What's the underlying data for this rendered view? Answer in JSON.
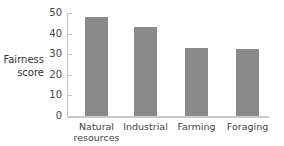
{
  "chart_data": {
    "type": "bar",
    "title": "",
    "xlabel": "",
    "ylabel": "Fairness score",
    "ylabel_lines": [
      "Fairness",
      "score"
    ],
    "ylim": [
      0,
      50
    ],
    "yticks": [
      "0",
      "10",
      "20",
      "30",
      "40",
      "50"
    ],
    "categories": [
      "Natural resources",
      "Industrial",
      "Farming",
      "Foraging"
    ],
    "category_lines": [
      [
        "Natural",
        "resources"
      ],
      [
        "Industrial"
      ],
      [
        "Farming"
      ],
      [
        "Foraging"
      ]
    ],
    "values": [
      48,
      43,
      33,
      32.5
    ],
    "bar_color": "#8a8a8a",
    "grid": false
  }
}
